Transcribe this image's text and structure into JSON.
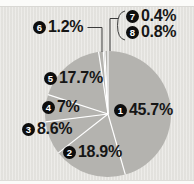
{
  "chart_data": {
    "type": "pie",
    "title": "",
    "unit": "%",
    "direction": "clockwise",
    "start_angle_deg": 0,
    "pie_color": "#b4b3af",
    "divider_color": "#ffffff",
    "background_color": "#e6e5e1",
    "leader_line_color": "#3c3c3c",
    "slices": [
      {
        "n": "1",
        "value": 45.7,
        "label": "45.7%"
      },
      {
        "n": "2",
        "value": 18.9,
        "label": "18.9%"
      },
      {
        "n": "3",
        "value": 8.6,
        "label": "8.6%"
      },
      {
        "n": "4",
        "value": 7,
        "label": "7%"
      },
      {
        "n": "5",
        "value": 17.7,
        "label": "17.7%"
      },
      {
        "n": "6",
        "value": 1.2,
        "label": "1.2%"
      },
      {
        "n": "7",
        "value": 0.4,
        "label": "0.4%"
      },
      {
        "n": "8",
        "value": 0.8,
        "label": "0.8%"
      }
    ]
  }
}
